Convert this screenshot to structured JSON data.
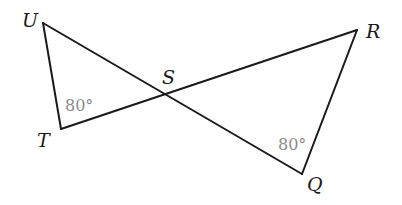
{
  "diagram": {
    "type": "geometry",
    "colors": {
      "line": "#1a1a1a",
      "angle_label": "#8c8c8c",
      "background": "#ffffff"
    },
    "vertices": {
      "U": {
        "label": "U",
        "x": 43,
        "y": 23
      },
      "T": {
        "label": "T",
        "x": 61,
        "y": 129
      },
      "S": {
        "label": "S",
        "x": 164,
        "y": 95
      },
      "R": {
        "label": "R",
        "x": 357,
        "y": 30
      },
      "Q": {
        "label": "Q",
        "x": 302,
        "y": 174
      }
    },
    "segments": [
      {
        "name": "UT",
        "from": "U",
        "to": "T"
      },
      {
        "name": "UQ",
        "from": "U",
        "to": "Q"
      },
      {
        "name": "TR",
        "from": "T",
        "to": "R"
      },
      {
        "name": "RQ",
        "from": "R",
        "to": "Q"
      }
    ],
    "angles": [
      {
        "vertex": "T",
        "label": "80°"
      },
      {
        "vertex": "Q",
        "label": "80°"
      }
    ]
  }
}
